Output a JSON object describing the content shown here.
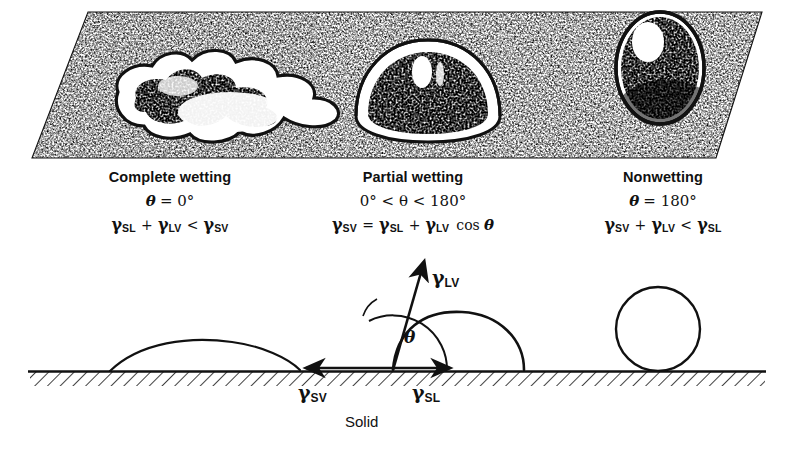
{
  "figure": {
    "title_semantic": "wetting-regimes-diagram",
    "colors": {
      "ink": "#111111",
      "paper": "#ffffff"
    }
  },
  "top_panel": {
    "name": "perspective-surface-with-droplets",
    "droplets": [
      {
        "id": "droplet-spread",
        "regime": "complete-wetting",
        "shape": "irregular-spread-puddle"
      },
      {
        "id": "droplet-dome",
        "regime": "partial-wetting",
        "shape": "dome-sessile-drop"
      },
      {
        "id": "droplet-sphere",
        "regime": "nonwetting",
        "shape": "near-spherical-ball"
      }
    ]
  },
  "captions": [
    {
      "title": "Complete wetting",
      "angle_symbol": "θ",
      "angle_relation": "= 0°",
      "angle_line": "θ = 0°",
      "energy_terms": [
        "γ",
        "SL",
        "+",
        "γ",
        "LV",
        "<",
        "γ",
        "SV"
      ],
      "energy_line": "γSL + γLV < γSV"
    },
    {
      "title": "Partial wetting",
      "angle_symbol": "θ",
      "angle_relation": "0° < θ < 180°",
      "angle_line": "0° < θ < 180°",
      "energy_terms": [
        "γ",
        "SV",
        "=",
        "γ",
        "SL",
        "+",
        "γ",
        "LV",
        "cos",
        "θ"
      ],
      "energy_line": "γSV = γSL + γLV cos θ"
    },
    {
      "title": "Nonwetting",
      "angle_symbol": "θ",
      "angle_relation": "= 180°",
      "angle_line": "θ = 180°",
      "energy_terms": [
        "γ",
        "SV",
        "+",
        "γ",
        "LV",
        "<",
        "γ",
        "SL"
      ],
      "energy_line": "γSV + γLV < γSL"
    }
  ],
  "bottom_panel": {
    "name": "force-balance-cross-section",
    "substrate_label": "Solid",
    "vectors": [
      {
        "id": "gamma-lv",
        "base": "γ",
        "subscript": "LV",
        "direction": "up-right-tangent"
      },
      {
        "id": "gamma-sv",
        "base": "γ",
        "subscript": "SV",
        "direction": "left-along-surface"
      },
      {
        "id": "gamma-sl",
        "base": "γ",
        "subscript": "SL",
        "direction": "right-along-surface"
      }
    ],
    "angle": {
      "id": "contact-angle",
      "symbol": "θ"
    },
    "profiles": [
      {
        "id": "profile-spread",
        "regime": "complete-wetting"
      },
      {
        "id": "profile-dome",
        "regime": "partial-wetting"
      },
      {
        "id": "profile-circle",
        "regime": "nonwetting"
      }
    ]
  }
}
